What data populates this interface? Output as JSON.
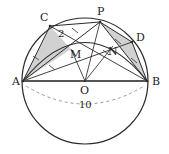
{
  "figure": {
    "kind": "circle-geometry-diagram",
    "canvas": {
      "width": 169,
      "height": 154
    },
    "colors": {
      "stroke": "#2b2b2b",
      "thick_stroke": "#555555",
      "shade_fill": "#c9c9c9",
      "dashed": "#9a9a9a",
      "text": "#1a1a1a",
      "background": "#ffffff"
    },
    "circle": {
      "center_label": "O",
      "center": {
        "x": 85,
        "y": 81
      },
      "radius": 63
    },
    "points": [
      {
        "name": "A",
        "label": "A",
        "x": 23,
        "y": 81,
        "label_x": 12,
        "label_y": 85
      },
      {
        "name": "B",
        "label": "B",
        "x": 147,
        "y": 81,
        "label_x": 152,
        "label_y": 85
      },
      {
        "name": "C",
        "label": "C",
        "x": 50,
        "y": 26,
        "label_x": 41,
        "label_y": 21
      },
      {
        "name": "P",
        "label": "P",
        "x": 100,
        "y": 22,
        "label_x": 98,
        "label_y": 15
      },
      {
        "name": "D",
        "label": "D",
        "x": 132,
        "y": 42,
        "label_x": 136,
        "label_y": 41
      },
      {
        "name": "M",
        "label": "M",
        "x": 71,
        "y": 49,
        "label_x": 72,
        "label_y": 56
      },
      {
        "name": "N",
        "label": "N",
        "x": 113,
        "y": 46,
        "label_x": 110,
        "label_y": 53
      },
      {
        "name": "O",
        "label": "O",
        "x": 85,
        "y": 81,
        "label_x": 81,
        "label_y": 93
      }
    ],
    "segments": [
      {
        "name": "AB-diameter",
        "from": "A",
        "to": "B",
        "style": "thick"
      },
      {
        "name": "AP",
        "from": "A",
        "to": "P",
        "style": "solid"
      },
      {
        "name": "AC",
        "from": "A",
        "to": "C",
        "style": "solid"
      },
      {
        "name": "CP",
        "from": "C",
        "to": "P",
        "style": "solid"
      },
      {
        "name": "PB",
        "from": "P",
        "to": "B",
        "style": "solid"
      },
      {
        "name": "PD",
        "from": "P",
        "to": "D",
        "style": "solid"
      },
      {
        "name": "DB",
        "from": "D",
        "to": "B",
        "style": "solid"
      },
      {
        "name": "AD",
        "from": "A",
        "to": "D",
        "style": "solid"
      },
      {
        "name": "CB",
        "from": "C",
        "to": "B",
        "style": "solid"
      },
      {
        "name": "OM",
        "from": "O",
        "to": "M",
        "style": "solid"
      },
      {
        "name": "ON",
        "from": "O",
        "to": "N",
        "style": "solid"
      },
      {
        "name": "OP",
        "from": "O",
        "to": "P",
        "style": "solid"
      }
    ],
    "shaded_regions": [
      {
        "name": "triangle-ACM",
        "vertices": [
          "A",
          "C",
          "M"
        ]
      },
      {
        "name": "triangle-PDB",
        "vertices": [
          "P",
          "D",
          "B"
        ]
      }
    ],
    "arcs": [
      {
        "name": "arc-APB-chord-arc",
        "from": "A",
        "to": "B",
        "via": "P",
        "style": "solid"
      },
      {
        "name": "dashed-diameter-arc",
        "from": "A",
        "to": "B",
        "style": "dashed"
      }
    ],
    "tick_marks": [
      {
        "name": "tick-AM",
        "on_segment": "AD",
        "count": 1
      },
      {
        "name": "tick-MD",
        "on_segment": "AD",
        "count": 1
      },
      {
        "name": "tick-CM",
        "on_segment": "CB",
        "count": 1
      },
      {
        "name": "tick-PN",
        "on_segment": "PB",
        "count": 1
      },
      {
        "name": "tick-NB",
        "on_segment": "PB",
        "count": 1
      }
    ],
    "measurements": [
      {
        "name": "segment-CM-length",
        "value": "2",
        "x": 61,
        "y": 34,
        "labels": "CM"
      },
      {
        "name": "diameter-length",
        "value": "10",
        "x": 85,
        "y": 105,
        "labels": "AB"
      }
    ]
  }
}
